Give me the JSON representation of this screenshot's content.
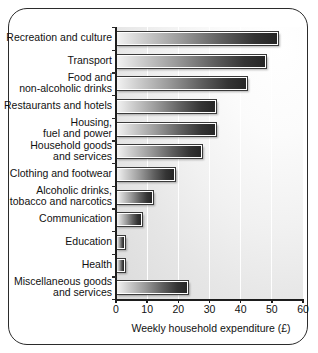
{
  "chart_data": {
    "type": "bar",
    "orientation": "horizontal",
    "title": "",
    "xlabel": "Weekly household expenditure (£)",
    "ylabel": "",
    "xlim": [
      0,
      60
    ],
    "xticks": [
      0,
      10,
      20,
      30,
      40,
      50,
      60
    ],
    "xticklabels": [
      "0",
      "10",
      "20",
      "30",
      "40",
      "50",
      "60"
    ],
    "grid": "vertical",
    "legend": "none",
    "categories": [
      "Recreation and culture",
      "Transport",
      "Food and\nnon-alcoholic drinks",
      "Restaurants and hotels",
      "Housing,\nfuel and power",
      "Household goods\nand services",
      "Clothing and footwear",
      "Alcoholic drinks,\ntobacco and narcotics",
      "Communication",
      "Education",
      "Health",
      "Miscellaneous goods\nand services"
    ],
    "values": [
      52,
      48,
      42,
      32,
      32,
      27.5,
      19,
      12,
      8.5,
      3,
      3,
      23
    ],
    "units": "£ per week",
    "bar_fill": "light-to-dark grey gradient",
    "colors": {
      "axis": "#1d1d1d",
      "text": "#111111",
      "bar_dark": "#262626",
      "bar_light": "#f2f2f2",
      "gridline": "#ffffff",
      "frame": "#2b2b2b",
      "plot_background": "#e6e6e6"
    }
  },
  "axis": {
    "x_title": "Weekly household expenditure (£)"
  }
}
